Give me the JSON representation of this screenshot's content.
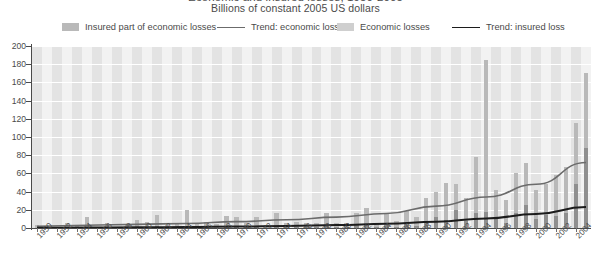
{
  "title": {
    "main": "Economic and insured losses, 1950-2005",
    "sub": "Billions of constant 2005 US dollars"
  },
  "legend": {
    "items": [
      {
        "label": "Insured part of economic losses",
        "type": "swatch",
        "color": "#b9b9b9",
        "x": 62
      },
      {
        "label": "Trend: economic loss",
        "type": "line",
        "color": "#6b6b6b",
        "x": 217
      },
      {
        "label": "Economic losses",
        "type": "swatch",
        "color": "#cfcfcf",
        "x": 337
      },
      {
        "label": "Trend: insured loss",
        "type": "line",
        "color": "#1c1c1c",
        "x": 452
      }
    ]
  },
  "axes": {
    "y": {
      "label": "",
      "min": 0,
      "max": 200,
      "step": 20,
      "ticks": [
        "200",
        "180",
        "160",
        "140",
        "120",
        "100",
        "80",
        "60",
        "40",
        "20",
        "0"
      ]
    },
    "x": {
      "label": "",
      "min": 1950,
      "max": 2005,
      "tick_step": 2,
      "ticks": [
        "1950",
        "1952",
        "1954",
        "1956",
        "1958",
        "1960",
        "1962",
        "1964",
        "1966",
        "1968",
        "1970",
        "1972",
        "1974",
        "1976",
        "1978",
        "1980",
        "1982",
        "1984",
        "1986",
        "1988",
        "1990",
        "1992",
        "1994",
        "1996",
        "1998",
        "2000",
        "2002",
        "2004"
      ]
    }
  },
  "chart_data": {
    "type": "bar",
    "title": "Economic and insured losses, 1950-2005",
    "subtitle": "Billions of constant 2005 US dollars",
    "xlabel": "",
    "ylabel": "Billions of constant 2005 US dollars",
    "ylim": [
      0,
      200
    ],
    "xlim": [
      1950,
      2005
    ],
    "grid": true,
    "legend_position": "top",
    "categories": [
      1950,
      1951,
      1952,
      1953,
      1954,
      1955,
      1956,
      1957,
      1958,
      1959,
      1960,
      1961,
      1962,
      1963,
      1964,
      1965,
      1966,
      1967,
      1968,
      1969,
      1970,
      1971,
      1972,
      1973,
      1974,
      1975,
      1976,
      1977,
      1978,
      1979,
      1980,
      1981,
      1982,
      1983,
      1984,
      1985,
      1986,
      1987,
      1988,
      1989,
      1990,
      1991,
      1992,
      1993,
      1994,
      1995,
      1996,
      1997,
      1998,
      1999,
      2000,
      2001,
      2002,
      2003,
      2004,
      2005
    ],
    "series": [
      {
        "name": "Economic losses",
        "color": "#b9b9b9",
        "values": [
          3,
          1,
          1,
          5,
          2,
          12,
          1,
          6,
          1,
          4,
          9,
          7,
          14,
          3,
          5,
          20,
          4,
          7,
          4,
          13,
          12,
          6,
          12,
          3,
          16,
          6,
          7,
          5,
          5,
          17,
          6,
          6,
          17,
          22,
          6,
          17,
          8,
          19,
          12,
          33,
          40,
          50,
          48,
          33,
          78,
          185,
          42,
          31,
          60,
          71,
          42,
          48,
          58,
          67,
          115,
          170
        ]
      },
      {
        "name": "Insured part of economic losses",
        "color": "#8f8f8f",
        "values": [
          0,
          0,
          0,
          0,
          0,
          1,
          0,
          1,
          0,
          0,
          1,
          1,
          2,
          0,
          0,
          2,
          0,
          1,
          0,
          2,
          1,
          1,
          2,
          0,
          2,
          1,
          1,
          1,
          1,
          2,
          1,
          1,
          3,
          4,
          1,
          3,
          1,
          4,
          2,
          7,
          12,
          9,
          20,
          8,
          16,
          18,
          12,
          6,
          17,
          25,
          10,
          14,
          13,
          17,
          48,
          88
        ]
      }
    ],
    "trend_lines": [
      {
        "name": "Trend: economic loss",
        "color": "#6b6b6b",
        "points": [
          [
            1950,
            2
          ],
          [
            1955,
            3
          ],
          [
            1960,
            4
          ],
          [
            1965,
            5
          ],
          [
            1970,
            7
          ],
          [
            1975,
            9
          ],
          [
            1980,
            12
          ],
          [
            1985,
            16
          ],
          [
            1990,
            24
          ],
          [
            1995,
            34
          ],
          [
            2000,
            48
          ],
          [
            2005,
            72
          ]
        ]
      },
      {
        "name": "Trend: insured loss",
        "color": "#1c1c1c",
        "points": [
          [
            1950,
            0.3
          ],
          [
            1955,
            0.5
          ],
          [
            1960,
            0.8
          ],
          [
            1965,
            1.1
          ],
          [
            1970,
            1.6
          ],
          [
            1975,
            2.2
          ],
          [
            1980,
            3.2
          ],
          [
            1985,
            4.6
          ],
          [
            1990,
            7.0
          ],
          [
            1995,
            10.5
          ],
          [
            2000,
            15.5
          ],
          [
            2005,
            23
          ]
        ]
      }
    ]
  },
  "colors": {
    "plot_background": "#f2f2f2",
    "band": "#e3e3e3",
    "gridline": "#ffffff",
    "bar_economic": "#b9b9b9",
    "bar_insured": "#8f8f8f",
    "trend_economic": "#6b6b6b",
    "trend_insured": "#1c1c1c",
    "text": "#4a4a4a"
  }
}
